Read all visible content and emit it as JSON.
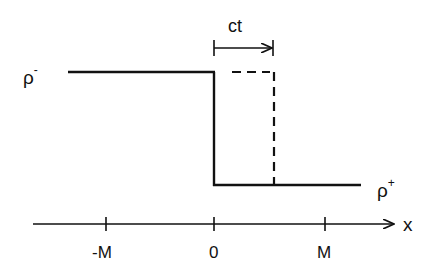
{
  "diagram": {
    "type": "shock-wave-step-profile",
    "labels": {
      "rho_minus": "ρ",
      "rho_minus_sup": "-",
      "rho_plus": "ρ",
      "rho_plus_sup": "+",
      "shift": "ct",
      "axis_var": "x",
      "tick_neg": "-M",
      "tick_zero": "0",
      "tick_pos": "M"
    },
    "elements": [
      "solid step profile from rho- (left) dropping at x=0 to rho+ (right)",
      "dashed profile shifted by ct to the right",
      "arrow labelled ct indicating shift",
      "x axis with ticks at -M, 0, M"
    ],
    "colors": {
      "ink": "#111111",
      "background": "#ffffff"
    }
  }
}
